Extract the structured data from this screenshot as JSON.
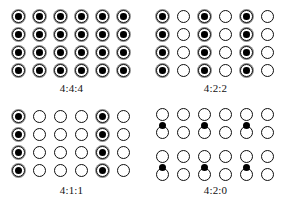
{
  "figure": {
    "background_color": "#ffffff",
    "sample_color": "#000000",
    "ring_color": "#8a8a8a",
    "grid": {
      "columns": 6,
      "rows": 4
    }
  },
  "panels": [
    {
      "id": "444",
      "label": "4:4:4",
      "position": "top-left",
      "description": "Every pixel carries a chroma sample; no subsampling.",
      "row_layout": "even",
      "chroma_dots": false,
      "filled_columns": [
        1,
        2,
        3,
        4,
        5,
        6
      ],
      "cells": [
        [
          1,
          1,
          1,
          1,
          1,
          1
        ],
        [
          1,
          1,
          1,
          1,
          1,
          1
        ],
        [
          1,
          1,
          1,
          1,
          1,
          1
        ],
        [
          1,
          1,
          1,
          1,
          1,
          1
        ]
      ]
    },
    {
      "id": "422",
      "label": "4:2:2",
      "position": "top-right",
      "description": "Chroma sampled on every second column; full vertical resolution.",
      "row_layout": "even",
      "chroma_dots": false,
      "filled_columns": [
        1,
        3,
        5
      ],
      "cells": [
        [
          1,
          0,
          1,
          0,
          1,
          0
        ],
        [
          1,
          0,
          1,
          0,
          1,
          0
        ],
        [
          1,
          0,
          1,
          0,
          1,
          0
        ],
        [
          1,
          0,
          1,
          0,
          1,
          0
        ]
      ]
    },
    {
      "id": "411",
      "label": "4:1:1",
      "position": "bottom-left",
      "description": "Chroma sampled on every fourth column; full vertical resolution.",
      "row_layout": "even",
      "chroma_dots": false,
      "filled_columns": [
        1,
        5
      ],
      "cells": [
        [
          1,
          0,
          0,
          0,
          1,
          0
        ],
        [
          1,
          0,
          0,
          0,
          1,
          0
        ],
        [
          1,
          0,
          0,
          0,
          1,
          0
        ],
        [
          1,
          0,
          0,
          0,
          1,
          0
        ]
      ]
    },
    {
      "id": "420",
      "label": "4:2:0",
      "position": "bottom-right",
      "description": "Chroma sampled every second column and shared between row pairs; dots sit between rows.",
      "row_layout": "paired",
      "chroma_dots": true,
      "chroma_dot_columns": [
        1,
        3,
        5
      ],
      "chroma_dot_row_pairs": [
        1,
        2
      ],
      "cells": [
        [
          0,
          0,
          0,
          0,
          0,
          0
        ],
        [
          0,
          0,
          0,
          0,
          0,
          0
        ],
        [
          0,
          0,
          0,
          0,
          0,
          0
        ],
        [
          0,
          0,
          0,
          0,
          0,
          0
        ]
      ]
    }
  ],
  "geometry": {
    "col_start_x": 12,
    "col_step_x": 21,
    "even_row_start_y": 10,
    "even_row_step_y": 18,
    "paired_rows_y": [
      8,
      26,
      50,
      68
    ],
    "paired_dot_y": [
      22,
      64
    ]
  }
}
